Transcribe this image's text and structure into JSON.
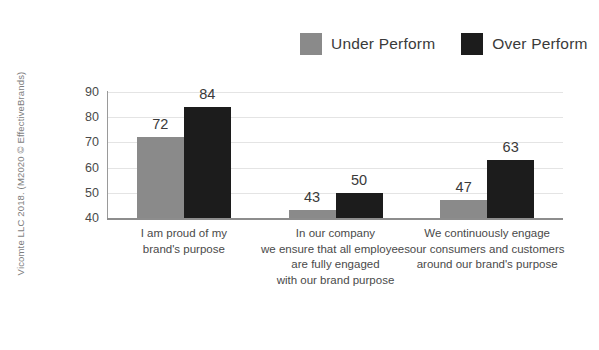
{
  "attribution": {
    "text": "Vicomte LLC 2018. (M2020 © EffectiveBrands)"
  },
  "legend": {
    "items": [
      {
        "label": "Under Perform",
        "color": "#8a8a8a",
        "swatch_icon": "legend-swatch-square"
      },
      {
        "label": "Over Perform",
        "color": "#1c1c1c",
        "swatch_icon": "legend-swatch-square"
      }
    ]
  },
  "chart_data": {
    "type": "bar",
    "title": "",
    "subtitle": "",
    "xlabel": "",
    "ylabel": "",
    "ylim": [
      40,
      90
    ],
    "yticks": [
      40,
      50,
      60,
      70,
      80,
      90
    ],
    "ytick_labels": [
      "40",
      "50",
      "60",
      "70",
      "80",
      "90"
    ],
    "grid": true,
    "legend_position": "top-right",
    "data_labels": true,
    "categories": [
      "I am proud of my brand's purpose",
      "In our company we ensure that all employees are fully engaged with our brand purpose",
      "We continuously engage our consumers and customers around our brand's purpose"
    ],
    "category_lines": [
      [
        "I am proud of my",
        "brand's purpose"
      ],
      [
        "In our company",
        "we ensure that all employees",
        "are fully engaged",
        "with our brand purpose"
      ],
      [
        "We continuously engage",
        "our consumers and customers",
        "around our brand's purpose"
      ]
    ],
    "series": [
      {
        "name": "Under Perform",
        "color": "#8a8a8a",
        "values": [
          72,
          43,
          47
        ]
      },
      {
        "name": "Over Perform",
        "color": "#1c1c1c",
        "values": [
          84,
          50,
          63
        ]
      }
    ]
  }
}
